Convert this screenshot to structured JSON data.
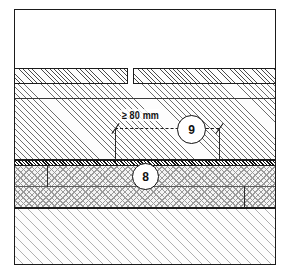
{
  "figure": {
    "type": "technical-section-drawing",
    "frame": {
      "stroke": "#1b1b1b"
    }
  },
  "dimension": {
    "label": "≥ 80 mm",
    "value": 80,
    "unit": "mm",
    "qualifier": "≥",
    "style": "dashed-with-slash-ticks"
  },
  "callouts": [
    {
      "id": "callout-9",
      "label": "9"
    },
    {
      "id": "callout-8",
      "label": "8"
    }
  ],
  "layers": [
    {
      "name": "void-above",
      "fill": "none",
      "label": ""
    },
    {
      "name": "tile-covering-left",
      "fill": "fine-hatch",
      "label": ""
    },
    {
      "name": "tile-covering-right",
      "fill": "fine-hatch",
      "label": ""
    },
    {
      "name": "screed",
      "fill": "medium-hatch",
      "label": ""
    },
    {
      "name": "sealing-membrane",
      "fill": "dense-hatch",
      "label": ""
    },
    {
      "name": "insulation",
      "fill": "stipple",
      "label": ""
    },
    {
      "name": "structural-slab",
      "fill": "light-hatch",
      "label": ""
    }
  ],
  "colors": {
    "line": "#1b1b1b",
    "hatch_fine": "#4a4a4a",
    "hatch_medium": "#6d6d6d",
    "hatch_light": "#b0b0b0",
    "membrane": "#111111",
    "stipple": "#9b9b9b",
    "background": "#ffffff"
  }
}
